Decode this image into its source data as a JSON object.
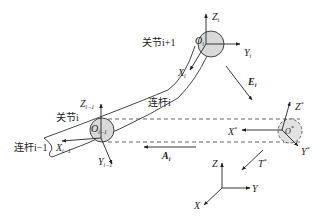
{
  "diagram": {
    "type": "robot-link-kinematics",
    "labels": {
      "joint_i_plus_1": "关节i+1",
      "joint_i": "关节i",
      "link_i": "连杆i",
      "link_i_minus_1": "连杆i−1",
      "O_i": "O",
      "O_i_sub": "i",
      "Z_i": "Z",
      "Y_i": "Y",
      "X_i": "X",
      "i_sub": "i",
      "O_im1": "O",
      "im1_sub": "i−1",
      "Z_im1": "Z",
      "X_im1": "X",
      "Y_im1": "Y",
      "E_i": "E",
      "A_i": "A",
      "T_star": "T",
      "O_star": "O",
      "X_star": "X",
      "Y_star": "Y",
      "Z_star": "Z",
      "star": "*",
      "world_Z": "Z",
      "world_Y": "Y",
      "world_X": "X"
    },
    "colors": {
      "line": "#333333",
      "joint_fill": "#d9d9d9",
      "background": "#ffffff"
    }
  }
}
